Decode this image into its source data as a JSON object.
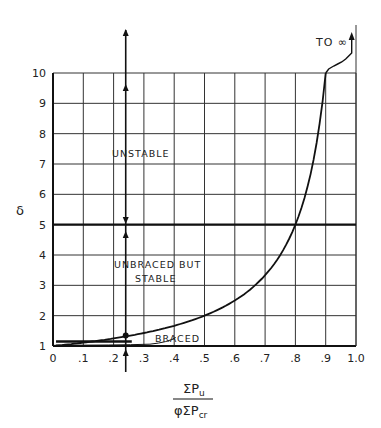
{
  "chart_data": {
    "type": "line",
    "title": "",
    "xlabel": "ΣPu / φΣPcr",
    "xlabel_numerator": "ΣP",
    "xlabel_numerator_sub": "u",
    "xlabel_denominator": "φΣP",
    "xlabel_denominator_sub": "cr",
    "ylabel": "δ",
    "xlim": [
      0,
      1.0
    ],
    "ylim": [
      1,
      10
    ],
    "grid": true,
    "x_ticks": [
      "0",
      ".1",
      ".2",
      ".3",
      ".4",
      ".5",
      ".6",
      ".7",
      ".8",
      ".9",
      "1.0"
    ],
    "y_ticks": [
      "1",
      "2",
      "3",
      "4",
      "5",
      "6",
      "7",
      "8",
      "9",
      "10"
    ],
    "series": [
      {
        "name": "amplification factor curve",
        "x": [
          0,
          0.1,
          0.2,
          0.3,
          0.4,
          0.5,
          0.6,
          0.7,
          0.75,
          0.8,
          0.85,
          0.9
        ],
        "y": [
          1.0,
          1.11,
          1.25,
          1.43,
          1.67,
          2.0,
          2.5,
          3.33,
          4.0,
          5.0,
          6.67,
          10.0
        ]
      }
    ],
    "reference_lines": [
      {
        "type": "horizontal",
        "y": 5,
        "x_from": 0,
        "x_to": 1.0,
        "style": "thick"
      },
      {
        "type": "horizontal",
        "y": 1.15,
        "x_from": 0.01,
        "x_to": 0.26,
        "style": "thick",
        "label": "BRACED"
      },
      {
        "type": "vertical",
        "x": 0.24,
        "style": "arrows"
      }
    ],
    "annotations": [
      {
        "text": "UNSTABLE",
        "x": 0.45,
        "y": 7.4
      },
      {
        "text": "UNBRACED BUT",
        "x": 0.45,
        "y": 3.7
      },
      {
        "text": "STABLE",
        "x": 0.45,
        "y": 3.3
      },
      {
        "text": "BRACED",
        "x": 0.47,
        "y": 1.3
      },
      {
        "text": "TO ∞",
        "x": 0.85,
        "y": 11.2
      }
    ],
    "legend_position": "none"
  },
  "labels": {
    "unstable": "UNSTABLE",
    "unbraced_1": "UNBRACED  BUT",
    "unbraced_2": "STABLE",
    "braced": "BRACED",
    "to_infinity": "TO ∞",
    "y_axis_symbol": "δ"
  }
}
